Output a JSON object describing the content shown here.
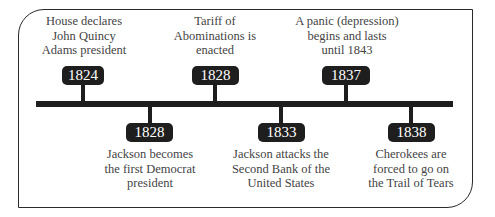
{
  "events": {
    "top": [
      {
        "year": "1824",
        "label": [
          "House declares",
          "John Quincy",
          "Adams president"
        ]
      },
      {
        "year": "1828",
        "label": [
          "Tariff of",
          "Abominations is",
          "enacted"
        ]
      },
      {
        "year": "1837",
        "label": [
          "A panic (depression)",
          "begins and lasts",
          "until 1843"
        ]
      }
    ],
    "bottom": [
      {
        "year": "1828",
        "label": [
          "Jackson becomes",
          "the first Democrat",
          "president"
        ]
      },
      {
        "year": "1833",
        "label": [
          "Jackson attacks the",
          "Second Bank of the",
          "United States"
        ]
      },
      {
        "year": "1838",
        "label": [
          "Cherokees are",
          "forced to go on",
          "the Trail of Tears"
        ]
      }
    ]
  },
  "colors": {
    "bar": "#1e1e1e",
    "year_badge_bg": "#1e1e1e",
    "year_badge_text": "#ffffff",
    "text": "#444444"
  }
}
